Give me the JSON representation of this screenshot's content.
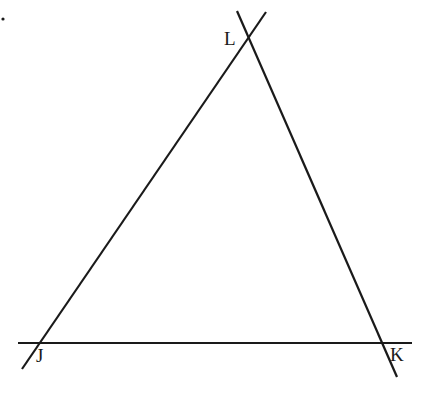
{
  "diagram": {
    "type": "triangle-with-extended-lines",
    "stroke_color": "#1a1a1a",
    "background": "#ffffff",
    "vertices": [
      {
        "id": "L",
        "label": "L",
        "x": 248,
        "y": 35,
        "label_x": 224,
        "label_y": 45
      },
      {
        "id": "J",
        "label": "J",
        "x": 37,
        "y": 343,
        "label_x": 36,
        "label_y": 362
      },
      {
        "id": "K",
        "label": "K",
        "x": 381,
        "y": 343,
        "label_x": 390,
        "label_y": 361
      }
    ],
    "lines": [
      {
        "id": "line-JK",
        "through": [
          "J",
          "K"
        ],
        "x1": 18,
        "y1": 343,
        "x2": 412,
        "y2": 343
      },
      {
        "id": "line-JL",
        "through": [
          "J",
          "L"
        ],
        "x1": 22,
        "y1": 369,
        "x2": 266,
        "y2": 12
      },
      {
        "id": "line-LK",
        "through": [
          "L",
          "K"
        ],
        "x1": 237,
        "y1": 11,
        "x2": 397,
        "y2": 377
      }
    ],
    "marker_dot": {
      "x": 3,
      "y": 19,
      "r": 1.6
    }
  }
}
